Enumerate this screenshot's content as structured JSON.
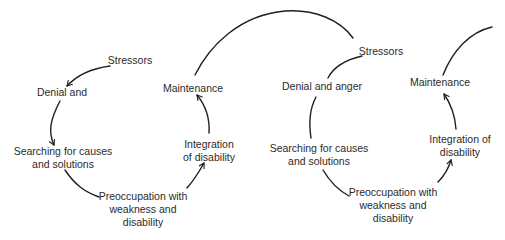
{
  "diagram": {
    "type": "spiral-cycle",
    "colors": {
      "background": "#ffffff",
      "line": "#1f1f1f",
      "text": "#2b2b2b"
    },
    "loops": [
      {
        "name": "loop-1",
        "stages": [
          {
            "id": "stressors",
            "lines": [
              "Stressors"
            ]
          },
          {
            "id": "denial",
            "lines": [
              "Denial and"
            ]
          },
          {
            "id": "searching",
            "lines": [
              "Searching for causes",
              "and solutions"
            ]
          },
          {
            "id": "preoccupation",
            "lines": [
              "Preoccupation with",
              "weakness and",
              "disability"
            ]
          },
          {
            "id": "integration",
            "lines": [
              "Integration",
              "of disability"
            ]
          },
          {
            "id": "maintenance",
            "lines": [
              "Maintenance"
            ]
          }
        ]
      },
      {
        "name": "loop-2",
        "stages": [
          {
            "id": "stressors",
            "lines": [
              "Stressors"
            ]
          },
          {
            "id": "denial",
            "lines": [
              "Denial and anger"
            ]
          },
          {
            "id": "searching",
            "lines": [
              "Searching for causes",
              "and solutions"
            ]
          },
          {
            "id": "preoccupation",
            "lines": [
              "Preoccupation with",
              "weakness and",
              "disability"
            ]
          },
          {
            "id": "integration",
            "lines": [
              "Integration of",
              "disability"
            ]
          },
          {
            "id": "maintenance",
            "lines": [
              "Maintenance"
            ]
          }
        ]
      }
    ]
  }
}
